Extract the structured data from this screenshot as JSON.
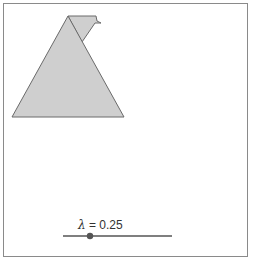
{
  "frame": {
    "border_color": "#8a8a8a"
  },
  "shape": {
    "fill": "#cfcfcf",
    "stroke": "#6a6a6a",
    "triangle": [
      [
        68,
        16
      ],
      [
        12,
        117
      ],
      [
        124,
        117
      ]
    ],
    "flap": [
      [
        68,
        16
      ],
      [
        96,
        16
      ],
      [
        97,
        21
      ],
      [
        101,
        23
      ],
      [
        95,
        23
      ],
      [
        82,
        42
      ]
    ]
  },
  "slider": {
    "symbol": "λ",
    "equals": " = ",
    "value": "0.25",
    "track_start": 63,
    "track_end": 172,
    "track_y": 236,
    "knob_x": 90
  }
}
